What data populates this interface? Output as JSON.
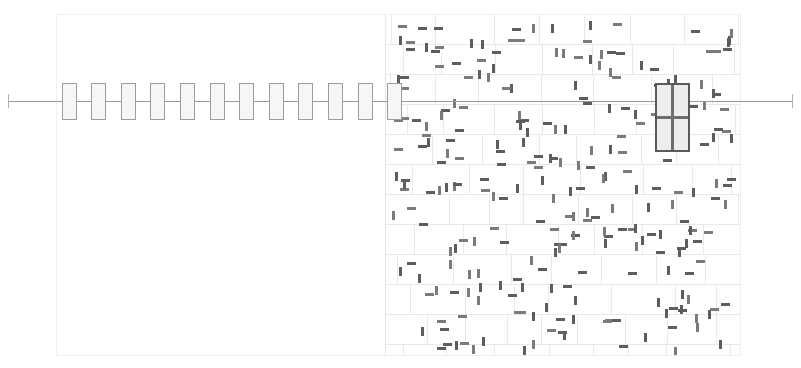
{
  "view": {
    "name": "plan-view",
    "background_color": "#ffffff",
    "width": 801,
    "height": 368
  },
  "viewport": {
    "name": "drawing-viewport",
    "x": 56,
    "y": 14,
    "width": 684,
    "height": 341,
    "border_color": "#f0f0f0",
    "border_width": 1
  },
  "axis": {
    "name": "centerline-axis",
    "label": "",
    "y": 101,
    "x_start": 8,
    "x_end": 792,
    "color": "#9a9a9a",
    "width": 1,
    "end_tick_half_height": 7,
    "end_tick_color": "#b0b0b0"
  },
  "stud_row": {
    "name": "stud-row",
    "count": 12,
    "first_x": 62,
    "spacing": 29.6,
    "width": 14,
    "height": 36,
    "center_y": 101,
    "stroke_color": "#9d9d9d",
    "fill_color": "#f6f6f6",
    "stroke_width": 1
  },
  "masonry": {
    "name": "masonry-wall-region",
    "x": 385,
    "y": 14,
    "width": 355,
    "height": 341,
    "course_height": 30,
    "courses": 12,
    "joint_color": "#e9e9e9",
    "joint_width": 1,
    "outline_color": "#e4e4e4",
    "fill_color": "#ffffff",
    "bond": "running-bond"
  },
  "anchors": {
    "name": "anchor-tie-marks",
    "color_dark": "#5d5d5d",
    "color_mid": "#7b7b7b",
    "vertical_length": 9,
    "vertical_thickness": 3,
    "horizontal_length": 9,
    "horizontal_thickness": 3,
    "count": 260
  },
  "selection": {
    "name": "selected-element-group",
    "label": "",
    "cells": [
      {
        "x": 656,
        "y": 84,
        "width": 16,
        "height": 33
      },
      {
        "x": 673,
        "y": 84,
        "width": 16,
        "height": 33
      },
      {
        "x": 656,
        "y": 118,
        "width": 16,
        "height": 33
      },
      {
        "x": 673,
        "y": 118,
        "width": 16,
        "height": 33
      }
    ],
    "stroke_color": "#6e6e6e",
    "stroke_width": 1.4,
    "fill_color": "#ededed",
    "outer_stroke_color": "#5a5a5a"
  },
  "colors": {
    "paper": "#ffffff",
    "light_grid": "#e9e9e9",
    "medium_line": "#9a9a9a",
    "dark_mark": "#5d5d5d",
    "selection": "#6e6e6e"
  }
}
